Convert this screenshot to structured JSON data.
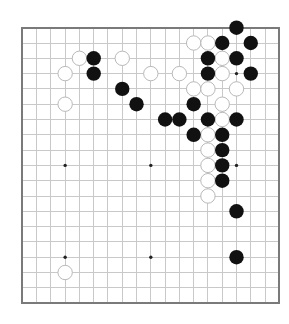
{
  "board": {
    "size": 19,
    "origin": {
      "x": 22.3,
      "y": 27.7
    },
    "cell": {
      "dx": 14.28,
      "dy": 15.3
    },
    "stone_radius": 7.2,
    "colors": {
      "background": "#ffffff",
      "grid": "#c9c9c9",
      "border": "#7a7a7a",
      "star": "#222222",
      "black_stone": "#111111",
      "white_stone": "#ffffff",
      "white_stone_outline": "#b9b9b9"
    },
    "star_points": [
      [
        3,
        3
      ],
      [
        9,
        3
      ],
      [
        15,
        3
      ],
      [
        3,
        9
      ],
      [
        9,
        9
      ],
      [
        15,
        9
      ],
      [
        3,
        15
      ],
      [
        9,
        15
      ],
      [
        15,
        15
      ]
    ],
    "black_stones": [
      [
        15,
        0
      ],
      [
        14,
        1
      ],
      [
        16,
        1
      ],
      [
        5,
        2
      ],
      [
        13,
        2
      ],
      [
        15,
        2
      ],
      [
        5,
        3
      ],
      [
        13,
        3
      ],
      [
        16,
        3
      ],
      [
        7,
        4
      ],
      [
        8,
        5
      ],
      [
        12,
        5
      ],
      [
        10,
        6
      ],
      [
        11,
        6
      ],
      [
        13,
        6
      ],
      [
        15,
        6
      ],
      [
        12,
        7
      ],
      [
        14,
        7
      ],
      [
        14,
        8
      ],
      [
        14,
        9
      ],
      [
        14,
        10
      ],
      [
        15,
        12
      ],
      [
        15,
        15
      ]
    ],
    "white_stones": [
      [
        12,
        1
      ],
      [
        13,
        1
      ],
      [
        4,
        2
      ],
      [
        7,
        2
      ],
      [
        14,
        2
      ],
      [
        3,
        3
      ],
      [
        9,
        3
      ],
      [
        11,
        3
      ],
      [
        14,
        3
      ],
      [
        12,
        4
      ],
      [
        13,
        4
      ],
      [
        15,
        4
      ],
      [
        3,
        5
      ],
      [
        14,
        5
      ],
      [
        14,
        6
      ],
      [
        13,
        7
      ],
      [
        13,
        8
      ],
      [
        13,
        9
      ],
      [
        13,
        10
      ],
      [
        13,
        11
      ],
      [
        3,
        16
      ]
    ]
  }
}
